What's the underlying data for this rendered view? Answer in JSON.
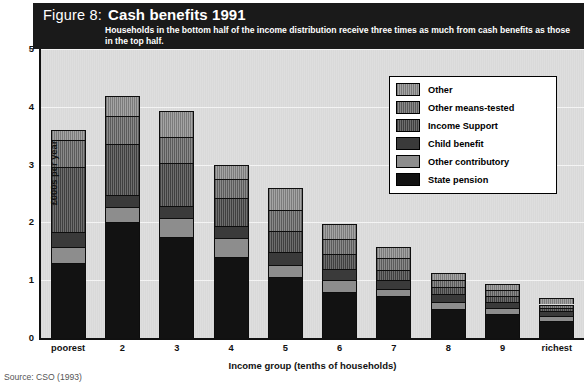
{
  "header": {
    "figure_number": "Figure 8:",
    "title": "Cash benefits 1991",
    "subtitle": "Households in the bottom half of the income distribution receive three times as much from cash benefits as those in the top half."
  },
  "source": "Source: CSO (1993)",
  "legend": {
    "items": [
      {
        "label": "Other",
        "pattern": "f-other",
        "color": "#8d8d8d"
      },
      {
        "label": "Other means-tested",
        "pattern": "f-othmeans",
        "color": "#6e6e6e"
      },
      {
        "label": "Income Support",
        "pattern": "f-incsupp",
        "color": "#555555"
      },
      {
        "label": "Child benefit",
        "pattern": "f-child",
        "color": "#3a3a3a"
      },
      {
        "label": "Other contributory",
        "pattern": "f-othcontrib",
        "color": "#8d8d8d"
      },
      {
        "label": "State pension",
        "pattern": "f-state",
        "color": "#121212"
      }
    ]
  },
  "chart_data": {
    "type": "bar",
    "subtype": "stacked",
    "title": "Cash benefits 1991",
    "subtitle": "Households in the bottom half of the income distribution receive three times as much from cash benefits as those in the top half.",
    "xlabel": "Income group (tenths of households)",
    "ylabel": "£000s per year",
    "ylim": [
      0,
      5
    ],
    "yticks": [
      0,
      1,
      2,
      3,
      4,
      5
    ],
    "grid": true,
    "legend_position": "top-right",
    "categories": [
      "poorest",
      "2",
      "3",
      "4",
      "5",
      "6",
      "7",
      "8",
      "9",
      "richest"
    ],
    "series": [
      {
        "name": "State pension",
        "values": [
          1.3,
          2.0,
          1.75,
          1.4,
          1.05,
          0.8,
          0.72,
          0.5,
          0.42,
          0.3
        ]
      },
      {
        "name": "Other contributory",
        "values": [
          0.28,
          0.26,
          0.33,
          0.33,
          0.22,
          0.2,
          0.13,
          0.12,
          0.1,
          0.08
        ]
      },
      {
        "name": "Child benefit",
        "values": [
          0.26,
          0.22,
          0.21,
          0.21,
          0.22,
          0.2,
          0.16,
          0.14,
          0.11,
          0.08
        ]
      },
      {
        "name": "Income Support",
        "values": [
          1.12,
          0.88,
          0.73,
          0.48,
          0.36,
          0.25,
          0.17,
          0.12,
          0.1,
          0.06
        ]
      },
      {
        "name": "Other means-tested",
        "values": [
          0.46,
          0.48,
          0.45,
          0.33,
          0.36,
          0.26,
          0.2,
          0.12,
          0.1,
          0.06
        ]
      },
      {
        "name": "Other",
        "values": [
          0.18,
          0.34,
          0.45,
          0.25,
          0.39,
          0.27,
          0.2,
          0.12,
          0.11,
          0.12
        ]
      }
    ],
    "totals": [
      3.6,
      4.18,
      3.92,
      3.0,
      2.6,
      1.98,
      1.58,
      1.12,
      0.94,
      0.7
    ]
  }
}
